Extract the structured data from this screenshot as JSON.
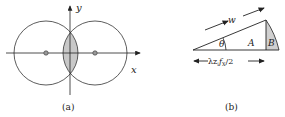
{
  "panel_a": {
    "caption": "(a)",
    "axis_x_label": "x",
    "axis_y_label": "y"
  },
  "panel_b": {
    "caption": "(b)",
    "hypotenuse_label": "w",
    "angle_label": "θ",
    "region_a_label": "A",
    "region_b_label": "B",
    "base_label": "λz",
    "base_label_sub": "i",
    "base_label_f": "f",
    "base_label_fsub": "X",
    "base_label_tail": "/2"
  },
  "colors": {
    "stroke": "#333333",
    "fill_shaded": "#c8c8c8",
    "background": "#ffffff"
  }
}
